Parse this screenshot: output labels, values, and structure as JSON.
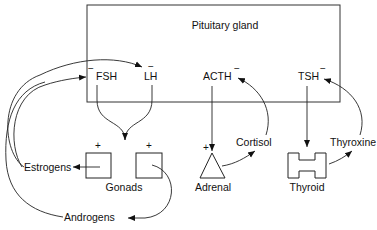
{
  "diagram": {
    "title": "Pituitary gland",
    "hormones_pituitary": [
      {
        "id": "fsh",
        "label": "FSH",
        "feedback_sign": "−"
      },
      {
        "id": "lh",
        "label": "LH",
        "feedback_sign": "−"
      },
      {
        "id": "acth",
        "label": "ACTH",
        "feedback_sign": "−"
      },
      {
        "id": "tsh",
        "label": "TSH",
        "feedback_sign": "−"
      }
    ],
    "target_glands": [
      {
        "id": "gonads",
        "label": "Gonads",
        "stimulation_sign": "+"
      },
      {
        "id": "adrenal",
        "label": "Adrenal",
        "stimulation_sign": "+"
      },
      {
        "id": "thyroid",
        "label": "Thyroid"
      }
    ],
    "products": [
      {
        "id": "estrogens",
        "label": "Estrogens"
      },
      {
        "id": "androgens",
        "label": "Androgens"
      },
      {
        "id": "cortisol",
        "label": "Cortisol"
      },
      {
        "id": "thyroxine",
        "label": "Thyroxine"
      }
    ],
    "plus_sign": "+",
    "minus_sign": "−"
  }
}
